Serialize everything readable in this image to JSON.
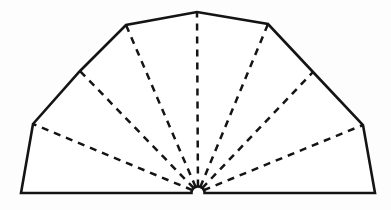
{
  "figure": {
    "kind": "line-drawing",
    "canvas": {
      "width": 391,
      "height": 210,
      "background": "#fdfdfd"
    },
    "colors": {
      "ink": "#141414",
      "fill": "#ffffff",
      "paper": "#fdfdfd"
    },
    "hub": {
      "label": "fold-convergence-point",
      "x": 198,
      "y": 192.5,
      "notch_radius": 6.5
    },
    "outline": {
      "label": "fan-outer-boundary",
      "stroke_width": 2.6,
      "style": "solid",
      "points": [
        {
          "name": "bottom-left-corner",
          "x": 21,
          "y": 193
        },
        {
          "name": "left-vertex",
          "x": 33,
          "y": 124
        },
        {
          "name": "upper-left-edge-midpoint",
          "x": 80,
          "y": 71
        },
        {
          "name": "left-shoulder",
          "x": 126,
          "y": 25
        },
        {
          "name": "apex",
          "x": 197,
          "y": 12
        },
        {
          "name": "right-shoulder",
          "x": 268,
          "y": 24
        },
        {
          "name": "upper-right-edge-midpoint",
          "x": 313,
          "y": 72
        },
        {
          "name": "right-vertex",
          "x": 363,
          "y": 125
        },
        {
          "name": "bottom-right-corner",
          "x": 375,
          "y": 193
        }
      ]
    },
    "fold_lines": {
      "label": "dashed-fold-rays",
      "count": 7,
      "style": "dashed",
      "stroke_width": 2.5,
      "dash_pattern": "7 6",
      "rays": [
        {
          "name": "fold-ray-1",
          "x": 33,
          "y": 124
        },
        {
          "name": "fold-ray-2",
          "x": 80,
          "y": 71
        },
        {
          "name": "fold-ray-3",
          "x": 126,
          "y": 25
        },
        {
          "name": "fold-ray-4",
          "x": 197,
          "y": 12
        },
        {
          "name": "fold-ray-5",
          "x": 268,
          "y": 24
        },
        {
          "name": "fold-ray-6",
          "x": 313,
          "y": 72
        },
        {
          "name": "fold-ray-7",
          "x": 363,
          "y": 125
        }
      ]
    },
    "baseline": {
      "label": "bottom-baseline",
      "left_x": 21,
      "right_x": 375,
      "y": 193
    }
  }
}
